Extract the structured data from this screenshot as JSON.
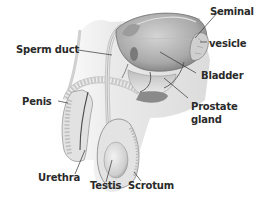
{
  "diagram": {
    "type": "anatomical-cross-section",
    "labels": {
      "sperm_duct": "Sperm duct",
      "seminal_vesicle_line1": "Seminal",
      "seminal_vesicle_line2": "vesicle",
      "bladder": "Bladder",
      "penis": "Penis",
      "prostate_line1": "Prostate",
      "prostate_line2": "gland",
      "urethra": "Urethra",
      "testis": "Testis",
      "scrotum": "Scrotum"
    },
    "colors": {
      "label_text": "#2a2a2a",
      "leader_line": "#333333",
      "tissue_light": "#e6e6e6",
      "tissue_mid": "#c8c8c8",
      "tissue_dark": "#8a8a8a",
      "outline": "#6f6f6f",
      "background": "#ffffff"
    }
  }
}
